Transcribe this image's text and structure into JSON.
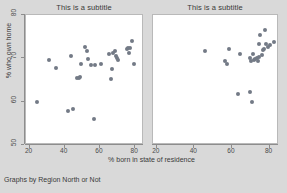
{
  "chart_data": {
    "type": "scatter",
    "title": "",
    "xlabel": "% born in state of residence",
    "ylabel": "% who own home",
    "note": "Graphs by Region North or Not",
    "xlim": [
      18,
      85
    ],
    "ylim": [
      50,
      80
    ],
    "xticks": [
      20,
      40,
      60,
      80
    ],
    "yticks": [
      50,
      60,
      70,
      80
    ],
    "grid": false,
    "legend": false,
    "marker_color": "#737a86",
    "panel_bg": "#ffffff",
    "figure_bg": "#d9d9d9",
    "panels": [
      {
        "subtitle": "This is a subtitle",
        "xticks": [
          20,
          40,
          60,
          80
        ],
        "points": [
          {
            "x": 24.0,
            "y": 59.9
          },
          {
            "x": 31.0,
            "y": 69.6
          },
          {
            "x": 35.0,
            "y": 67.7
          },
          {
            "x": 41.8,
            "y": 57.9
          },
          {
            "x": 43.3,
            "y": 70.6
          },
          {
            "x": 44.9,
            "y": 58.4
          },
          {
            "x": 47.0,
            "y": 65.5
          },
          {
            "x": 48.1,
            "y": 65.4
          },
          {
            "x": 48.8,
            "y": 65.7
          },
          {
            "x": 49.4,
            "y": 68.7
          },
          {
            "x": 51.6,
            "y": 72.6
          },
          {
            "x": 52.6,
            "y": 71.8
          },
          {
            "x": 53.3,
            "y": 69.9
          },
          {
            "x": 54.7,
            "y": 68.4
          },
          {
            "x": 56.6,
            "y": 55.9
          },
          {
            "x": 57.3,
            "y": 68.4
          },
          {
            "x": 60.5,
            "y": 68.8
          },
          {
            "x": 65.4,
            "y": 70.9
          },
          {
            "x": 66.0,
            "y": 65.3
          },
          {
            "x": 66.7,
            "y": 67.5
          },
          {
            "x": 67.3,
            "y": 71.3
          },
          {
            "x": 68.3,
            "y": 71.6
          },
          {
            "x": 69.0,
            "y": 70.6
          },
          {
            "x": 69.4,
            "y": 70.0
          },
          {
            "x": 70.0,
            "y": 69.7
          },
          {
            "x": 75.3,
            "y": 72.1
          },
          {
            "x": 76.1,
            "y": 72.5
          },
          {
            "x": 76.7,
            "y": 71.3
          },
          {
            "x": 77.3,
            "y": 72.4
          },
          {
            "x": 78.2,
            "y": 74.0
          },
          {
            "x": 79.4,
            "y": 68.7
          }
        ]
      },
      {
        "subtitle": "This is a subtitle",
        "xticks": [
          20,
          40,
          60,
          80
        ],
        "points": [
          {
            "x": 45.4,
            "y": 71.8
          },
          {
            "x": 56.4,
            "y": 69.3
          },
          {
            "x": 57.3,
            "y": 68.8
          },
          {
            "x": 58.3,
            "y": 72.1
          },
          {
            "x": 63.3,
            "y": 61.8
          },
          {
            "x": 64.4,
            "y": 71.1
          },
          {
            "x": 69.4,
            "y": 70.0
          },
          {
            "x": 69.8,
            "y": 62.3
          },
          {
            "x": 70.3,
            "y": 69.5
          },
          {
            "x": 70.7,
            "y": 59.9
          },
          {
            "x": 71.0,
            "y": 71.0
          },
          {
            "x": 71.6,
            "y": 69.6
          },
          {
            "x": 72.2,
            "y": 69.8
          },
          {
            "x": 73.1,
            "y": 70.0
          },
          {
            "x": 73.6,
            "y": 69.5
          },
          {
            "x": 74.1,
            "y": 73.3
          },
          {
            "x": 74.6,
            "y": 70.3
          },
          {
            "x": 75.0,
            "y": 75.5
          },
          {
            "x": 75.8,
            "y": 70.8
          },
          {
            "x": 76.4,
            "y": 71.9
          },
          {
            "x": 77.0,
            "y": 72.2
          },
          {
            "x": 77.6,
            "y": 76.6
          },
          {
            "x": 78.1,
            "y": 73.2
          },
          {
            "x": 79.1,
            "y": 72.6
          },
          {
            "x": 80.3,
            "y": 73.0
          },
          {
            "x": 82.2,
            "y": 73.7
          }
        ]
      }
    ]
  }
}
